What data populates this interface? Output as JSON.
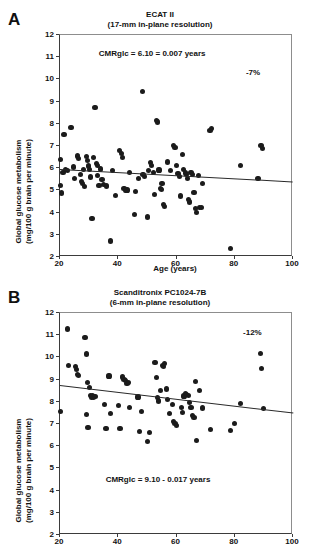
{
  "figure": {
    "panels": [
      {
        "letter": "A",
        "title_line1": "ECAT II",
        "title_line2": "(17-mm in-plane resolution)",
        "equation": "CMRglc = 6.10 = 0.007 years",
        "percent_change": "-7%",
        "xlabel": "Age (years)",
        "ylabel_line1": "Global glucose metabolism",
        "ylabel_line2": "(mg/100 g brain per minute)"
      },
      {
        "letter": "B",
        "title_line1": "Scanditronix PC1024-7B",
        "title_line2": "(6-mm in-plane resolution)",
        "equation": "CMRglc = 9.10 - 0.017 years",
        "percent_change": "-12%",
        "xlabel": "",
        "ylabel_line1": "Global glucose metabolism",
        "ylabel_line2": "(mg/100 g brain per minute)"
      }
    ]
  },
  "chart_data": [
    {
      "type": "scatter",
      "panel": "A",
      "title": "ECAT II (17-mm in-plane resolution)",
      "xlabel": "Age (years)",
      "ylabel": "Global glucose metabolism (mg/100 g brain per minute)",
      "xlim": [
        20,
        100
      ],
      "ylim": [
        2,
        12
      ],
      "xticks": [
        20,
        40,
        60,
        80,
        100
      ],
      "yticks": [
        2,
        3,
        4,
        5,
        6,
        7,
        8,
        9,
        10,
        11,
        12
      ],
      "grid": false,
      "legend": "none",
      "annotations": [
        {
          "text": "CMRglc = 6.10 = 0.007 years",
          "x": 52,
          "y": 11.1
        },
        {
          "text": "-7%",
          "x": 89,
          "y": 10.25
        }
      ],
      "regression": {
        "label": "CMRglc = 6.10 - 0.007 years",
        "intercept": 6.1,
        "slope": -0.007,
        "x_start": 20,
        "x_end": 100,
        "y_start": 5.96,
        "y_end": 5.4
      },
      "points": [
        [
          20.2,
          6.38
        ],
        [
          20.3,
          5.22
        ],
        [
          20.5,
          4.88
        ],
        [
          21.0,
          5.8
        ],
        [
          21.4,
          7.5
        ],
        [
          22.0,
          5.95
        ],
        [
          22.6,
          5.88
        ],
        [
          23.8,
          7.84
        ],
        [
          24.5,
          6.05
        ],
        [
          25.0,
          5.52
        ],
        [
          26.0,
          6.55
        ],
        [
          26.4,
          6.45
        ],
        [
          27.0,
          5.72
        ],
        [
          27.5,
          5.4
        ],
        [
          27.8,
          5.3
        ],
        [
          28.0,
          5.95
        ],
        [
          28.4,
          5.18
        ],
        [
          29.0,
          6.52
        ],
        [
          29.4,
          6.35
        ],
        [
          29.8,
          6.1
        ],
        [
          30.2,
          5.95
        ],
        [
          30.6,
          5.6
        ],
        [
          31.0,
          3.72
        ],
        [
          31.5,
          6.48
        ],
        [
          32.0,
          8.74
        ],
        [
          32.4,
          6.22
        ],
        [
          32.8,
          6.12
        ],
        [
          33.0,
          5.66
        ],
        [
          33.4,
          5.22
        ],
        [
          34.0,
          5.96
        ],
        [
          34.4,
          5.48
        ],
        [
          35.0,
          5.28
        ],
        [
          36.0,
          5.2
        ],
        [
          37.2,
          2.72
        ],
        [
          38.0,
          5.88
        ],
        [
          39.0,
          4.76
        ],
        [
          40.5,
          6.78
        ],
        [
          41.0,
          6.68
        ],
        [
          41.5,
          6.48
        ],
        [
          42.0,
          5.1
        ],
        [
          42.4,
          4.98
        ],
        [
          43.0,
          5.02
        ],
        [
          44.0,
          5.82
        ],
        [
          45.5,
          3.9
        ],
        [
          46.0,
          4.95
        ],
        [
          47.0,
          5.55
        ],
        [
          48.2,
          9.44
        ],
        [
          48.5,
          5.72
        ],
        [
          49.0,
          5.62
        ],
        [
          50.0,
          3.8
        ],
        [
          50.5,
          5.9
        ],
        [
          51.0,
          6.25
        ],
        [
          51.5,
          6.12
        ],
        [
          52.0,
          5.82
        ],
        [
          52.4,
          4.8
        ],
        [
          53.0,
          8.14
        ],
        [
          53.5,
          8.08
        ],
        [
          54.0,
          5.92
        ],
        [
          54.4,
          5.1
        ],
        [
          54.8,
          5.05
        ],
        [
          55.0,
          5.3
        ],
        [
          55.5,
          4.38
        ],
        [
          55.8,
          4.28
        ],
        [
          57.0,
          6.28
        ],
        [
          58.0,
          5.88
        ],
        [
          59.0,
          7.02
        ],
        [
          59.5,
          6.92
        ],
        [
          60.0,
          6.12
        ],
        [
          60.5,
          5.75
        ],
        [
          61.0,
          5.62
        ],
        [
          61.5,
          4.75
        ],
        [
          62.0,
          6.62
        ],
        [
          62.5,
          5.95
        ],
        [
          63.0,
          5.78
        ],
        [
          63.4,
          5.7
        ],
        [
          63.8,
          5.55
        ],
        [
          64.0,
          4.58
        ],
        [
          64.5,
          4.48
        ],
        [
          65.0,
          5.8
        ],
        [
          65.5,
          5.7
        ],
        [
          66.0,
          4.92
        ],
        [
          66.5,
          4.2
        ],
        [
          67.0,
          4.02
        ],
        [
          67.5,
          5.68
        ],
        [
          68.0,
          4.24
        ],
        [
          68.5,
          4.22
        ],
        [
          69.0,
          5.32
        ],
        [
          71.5,
          7.7
        ],
        [
          72.0,
          7.78
        ],
        [
          78.5,
          2.38
        ],
        [
          82.0,
          6.12
        ],
        [
          88.0,
          5.52
        ],
        [
          89.0,
          7.02
        ],
        [
          89.5,
          6.88
        ]
      ]
    },
    {
      "type": "scatter",
      "panel": "B",
      "title": "Scanditronix PC1024-7B (6-mm in-plane resolution)",
      "xlabel": "Age (years)",
      "ylabel": "Global glucose metabolism (mg/100 g brain per minute)",
      "xlim": [
        20,
        100
      ],
      "ylim": [
        2,
        12
      ],
      "xticks": [
        20,
        40,
        60,
        80,
        100
      ],
      "yticks": [
        2,
        3,
        4,
        5,
        6,
        7,
        8,
        9,
        10,
        11,
        12
      ],
      "grid": false,
      "legend": "none",
      "annotations": [
        {
          "text": "-12%",
          "x": 88,
          "y": 11.05
        },
        {
          "text": "CMRglc = 9.10 - 0.017 years",
          "x": 54,
          "y": 4.45
        }
      ],
      "regression": {
        "label": "CMRglc = 9.10 - 0.017 years",
        "intercept": 9.1,
        "slope": -0.017,
        "x_start": 20,
        "x_end": 100,
        "y_start": 8.76,
        "y_end": 7.52
      },
      "points": [
        [
          20.3,
          7.56
        ],
        [
          22.6,
          11.28
        ],
        [
          23.0,
          9.62
        ],
        [
          25.2,
          9.58
        ],
        [
          25.6,
          9.44
        ],
        [
          26.0,
          9.22
        ],
        [
          26.4,
          9.18
        ],
        [
          28.6,
          10.9
        ],
        [
          29.0,
          10.15
        ],
        [
          29.4,
          8.88
        ],
        [
          29.0,
          7.44
        ],
        [
          29.6,
          6.86
        ],
        [
          30.2,
          8.64
        ],
        [
          30.5,
          8.28
        ],
        [
          30.8,
          8.22
        ],
        [
          31.2,
          8.3
        ],
        [
          31.6,
          8.2
        ],
        [
          32.0,
          8.24
        ],
        [
          35.4,
          7.88
        ],
        [
          35.8,
          6.8
        ],
        [
          36.8,
          9.16
        ],
        [
          37.4,
          7.46
        ],
        [
          40.0,
          7.84
        ],
        [
          40.6,
          6.8
        ],
        [
          41.4,
          9.12
        ],
        [
          42.0,
          9.02
        ],
        [
          42.6,
          8.96
        ],
        [
          43.0,
          8.84
        ],
        [
          43.4,
          8.88
        ],
        [
          44.0,
          7.76
        ],
        [
          46.8,
          8.22
        ],
        [
          47.2,
          6.66
        ],
        [
          48.0,
          7.56
        ],
        [
          50.0,
          6.22
        ],
        [
          50.6,
          6.6
        ],
        [
          52.6,
          9.78
        ],
        [
          53.0,
          9.08
        ],
        [
          53.4,
          8.18
        ],
        [
          53.8,
          8.04
        ],
        [
          54.5,
          8.52
        ],
        [
          55.2,
          9.62
        ],
        [
          55.6,
          9.58
        ],
        [
          56.0,
          9.72
        ],
        [
          56.5,
          8.58
        ],
        [
          57.0,
          8.1
        ],
        [
          57.6,
          7.48
        ],
        [
          58.6,
          7.88
        ],
        [
          59.0,
          7.12
        ],
        [
          59.5,
          7.02
        ],
        [
          60.0,
          6.92
        ],
        [
          61.6,
          7.76
        ],
        [
          62.0,
          7.52
        ],
        [
          62.6,
          8.26
        ],
        [
          63.0,
          8.38
        ],
        [
          63.5,
          8.34
        ],
        [
          64.0,
          8.3
        ],
        [
          64.5,
          7.96
        ],
        [
          65.0,
          7.74
        ],
        [
          65.5,
          7.4
        ],
        [
          66.0,
          7.3
        ],
        [
          66.4,
          8.92
        ],
        [
          66.8,
          6.24
        ],
        [
          68.0,
          8.5
        ],
        [
          69.0,
          7.72
        ],
        [
          71.6,
          6.76
        ],
        [
          78.6,
          6.72
        ],
        [
          79.8,
          7.04
        ],
        [
          82.0,
          7.92
        ],
        [
          88.8,
          10.16
        ],
        [
          89.2,
          9.5
        ],
        [
          89.8,
          7.68
        ]
      ]
    }
  ]
}
